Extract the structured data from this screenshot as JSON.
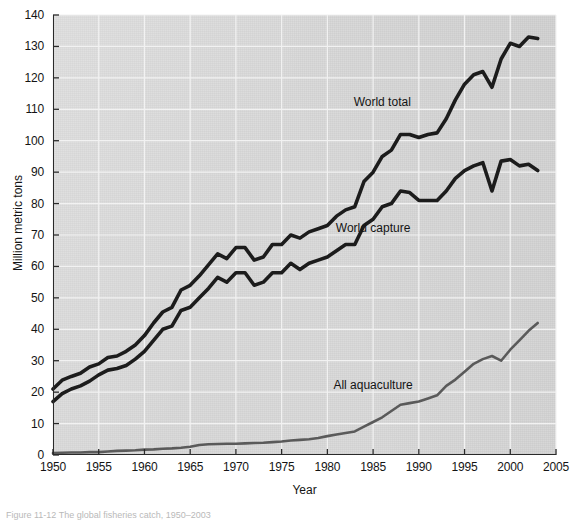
{
  "figure": {
    "caption": "Figure 11-12 The global fisheries catch, 1950–2003"
  },
  "chart_data": {
    "type": "line",
    "title": "",
    "xlabel": "Year",
    "ylabel": "Million metric tons",
    "xlim": [
      1950,
      2005
    ],
    "ylim": [
      0,
      140
    ],
    "xticks": [
      1950,
      1955,
      1960,
      1965,
      1970,
      1975,
      1980,
      1985,
      1990,
      1995,
      2000,
      2005
    ],
    "yticks": [
      0,
      10,
      20,
      30,
      40,
      50,
      60,
      70,
      80,
      90,
      100,
      110,
      120,
      130,
      140
    ],
    "grid": true,
    "grid_color": "#f2f2f2",
    "plot_background": "#d9d9d9",
    "legend_position": "inline-annotations",
    "x": [
      1950,
      1951,
      1952,
      1953,
      1954,
      1955,
      1956,
      1957,
      1958,
      1959,
      1960,
      1961,
      1962,
      1963,
      1964,
      1965,
      1966,
      1967,
      1968,
      1969,
      1970,
      1971,
      1972,
      1973,
      1974,
      1975,
      1976,
      1977,
      1978,
      1979,
      1980,
      1981,
      1982,
      1983,
      1984,
      1985,
      1986,
      1987,
      1988,
      1989,
      1990,
      1991,
      1992,
      1993,
      1994,
      1995,
      1996,
      1997,
      1998,
      1999,
      2000,
      2001,
      2002,
      2003
    ],
    "series": [
      {
        "name": "World total",
        "color": "#1c1c1c",
        "width": 3.6,
        "label_text": "World total",
        "values": [
          21.0,
          23.8,
          25.0,
          26.0,
          28.0,
          29.0,
          31.0,
          31.5,
          33.0,
          35.0,
          38.0,
          42.0,
          45.5,
          47.0,
          52.5,
          54.0,
          57.0,
          60.5,
          64.0,
          62.5,
          66.0,
          66.0,
          62.0,
          63.0,
          67.0,
          67.0,
          70.0,
          69.0,
          71.0,
          72.0,
          73.0,
          76.0,
          78.0,
          79.0,
          87.0,
          90.0,
          95.0,
          97.0,
          102.0,
          102.0,
          101.0,
          102.0,
          102.5,
          107.0,
          113.0,
          118.0,
          121.0,
          122.0,
          117.0,
          126.0,
          131.0,
          130.0,
          133.0,
          132.5
        ]
      },
      {
        "name": "World capture",
        "color": "#1c1c1c",
        "width": 3.6,
        "label_text": "World capture",
        "values": [
          17.0,
          19.5,
          21.0,
          22.0,
          23.5,
          25.5,
          27.0,
          27.5,
          28.5,
          30.5,
          33.0,
          36.5,
          40.0,
          41.0,
          46.0,
          47.0,
          50.0,
          53.0,
          56.5,
          55.0,
          58.0,
          58.0,
          54.0,
          55.0,
          58.0,
          58.0,
          61.0,
          59.0,
          61.0,
          62.0,
          63.0,
          65.0,
          67.0,
          67.0,
          73.0,
          75.0,
          79.0,
          80.0,
          84.0,
          83.5,
          81.0,
          81.0,
          81.0,
          84.0,
          88.0,
          90.5,
          92.0,
          93.0,
          84.0,
          93.5,
          94.0,
          92.0,
          92.5,
          90.5
        ]
      },
      {
        "name": "All aquaculture",
        "color": "#5a5a5a",
        "width": 2.6,
        "label_text": "All aquaculture",
        "values": [
          0.6,
          0.7,
          0.8,
          0.8,
          0.9,
          0.9,
          1.1,
          1.3,
          1.4,
          1.5,
          1.7,
          1.8,
          2.0,
          2.1,
          2.3,
          2.6,
          3.2,
          3.4,
          3.5,
          3.6,
          3.6,
          3.7,
          3.8,
          3.9,
          4.1,
          4.3,
          4.6,
          4.8,
          5.0,
          5.4,
          6.0,
          6.5,
          7.0,
          7.5,
          9.0,
          10.5,
          12.0,
          14.0,
          16.0,
          16.5,
          17.0,
          18.0,
          19.0,
          22.0,
          24.0,
          26.5,
          29.0,
          30.5,
          31.5,
          30.0,
          33.5,
          36.5,
          39.5,
          42.0
        ]
      }
    ],
    "annotations": [
      {
        "text": "World total",
        "x": 1986,
        "y": 112
      },
      {
        "text": "World capture",
        "x": 1985,
        "y": 72
      },
      {
        "text": "All aquaculture",
        "x": 1985,
        "y": 22
      }
    ]
  }
}
